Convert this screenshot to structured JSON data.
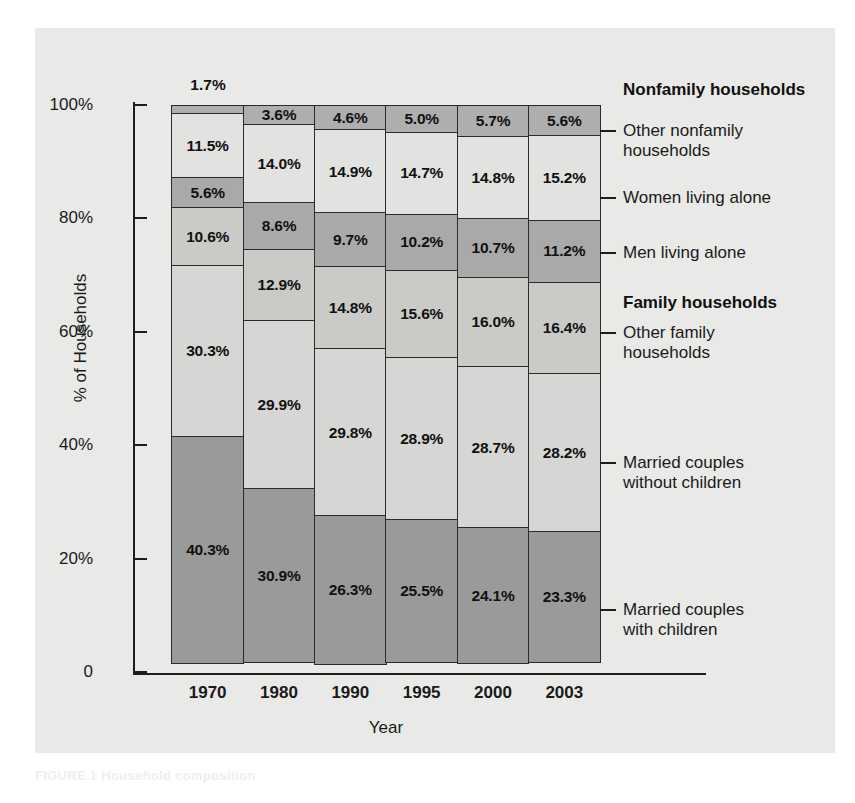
{
  "figure": {
    "background_color": "#e9e9e7",
    "page_background": "#ffffff"
  },
  "axes": {
    "y_title": "% of Households",
    "x_title": "Year",
    "y_ticks": [
      "100%",
      "80%",
      "60%",
      "40%",
      "20%",
      "0"
    ],
    "y_tick_values": [
      100,
      80,
      60,
      40,
      20,
      0
    ],
    "x_ticks": [
      "1970",
      "1980",
      "1990",
      "1995",
      "2000",
      "2003"
    ]
  },
  "annotations": {
    "top_value_1970": "1.7%"
  },
  "legend": {
    "group_headers": [
      {
        "label": "Nonfamily households"
      },
      {
        "label": "Family households"
      }
    ],
    "entries": [
      {
        "label": "Other nonfamily\nhouseholds"
      },
      {
        "label": "Women living alone"
      },
      {
        "label": "Men living alone"
      },
      {
        "label": "Other family\nhouseholds"
      },
      {
        "label": "Married couples\nwithout children"
      },
      {
        "label": "Married couples\nwith children"
      }
    ]
  },
  "bottom_caption": "FIGURE 1 Household composition",
  "chart_data": {
    "type": "bar",
    "stacked": true,
    "stack_mode": "percent",
    "title": "",
    "xlabel": "Year",
    "ylabel": "% of Households",
    "ylim": [
      0,
      100
    ],
    "grid": false,
    "legend_position": "right",
    "categories": [
      "1970",
      "1980",
      "1990",
      "1995",
      "2000",
      "2003"
    ],
    "series": [
      {
        "name": "Married couples with children",
        "group": "Family households",
        "color": "#9a9a9a",
        "values": [
          40.3,
          30.9,
          26.3,
          25.5,
          24.1,
          23.3
        ],
        "labels": [
          "40.3%",
          "30.9%",
          "26.3%",
          "25.5%",
          "24.1%",
          "23.3%"
        ]
      },
      {
        "name": "Married couples without children",
        "group": "Family households",
        "color": "#d6d6d4",
        "values": [
          30.3,
          29.9,
          29.8,
          28.9,
          28.7,
          28.2
        ],
        "labels": [
          "30.3%",
          "29.9%",
          "29.8%",
          "28.9%",
          "28.7%",
          "28.2%"
        ]
      },
      {
        "name": "Other family households",
        "group": "Family households",
        "color": "#cacac7",
        "values": [
          10.6,
          12.9,
          14.8,
          15.6,
          16.0,
          16.4
        ],
        "labels": [
          "10.6%",
          "12.9%",
          "14.8%",
          "15.6%",
          "16.0%",
          "16.4%"
        ]
      },
      {
        "name": "Men living alone",
        "group": "Nonfamily households",
        "color": "#a9a9a9",
        "values": [
          5.6,
          8.6,
          9.7,
          10.2,
          10.7,
          11.2
        ],
        "labels": [
          "5.6%",
          "8.6%",
          "9.7%",
          "10.2%",
          "10.7%",
          "11.2%"
        ]
      },
      {
        "name": "Women living alone",
        "group": "Nonfamily households",
        "color": "#e2e2e0",
        "values": [
          11.5,
          14.0,
          14.9,
          14.7,
          14.8,
          15.2
        ],
        "labels": [
          "11.5%",
          "14.0%",
          "14.9%",
          "14.7%",
          "14.8%",
          "15.2%"
        ]
      },
      {
        "name": "Other nonfamily households",
        "group": "Nonfamily households",
        "color": "#aeaeae",
        "values": [
          1.7,
          3.6,
          4.6,
          5.0,
          5.7,
          5.6
        ],
        "labels": [
          "1.7%",
          "3.6%",
          "4.6%",
          "5.0%",
          "5.7%",
          "5.6%"
        ],
        "label_outside": [
          true,
          false,
          false,
          false,
          false,
          false
        ]
      }
    ]
  }
}
